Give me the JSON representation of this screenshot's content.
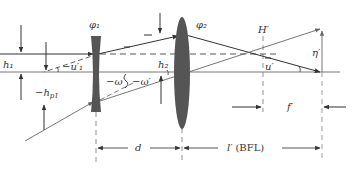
{
  "diagram": {
    "colors": {
      "line": "#333333",
      "ray": "#555555",
      "lens": "#555555",
      "dash": "#888888",
      "background": "#ffffff"
    },
    "labels": {
      "phi1": "φ₁",
      "phi2": "φ₂",
      "h1": "h₁",
      "h2": "h₂",
      "hp1": "−h",
      "hp1_sub": "p1",
      "u1p": "−u′₁",
      "omega": "−ω",
      "omegap": "−ω′",
      "Hp": "H′",
      "up": "u′",
      "etap": "η′",
      "fp": "f′",
      "d": "d",
      "lp": "l′",
      "bfl": "(BFL)",
      "dash_mark": "−"
    },
    "elements": {
      "lens1": {
        "type": "negative",
        "x": 96
      },
      "lens2": {
        "type": "positive",
        "x": 182
      },
      "principal_plane_Hp": {
        "x": 263
      },
      "focal_point": {
        "x": 322
      }
    }
  }
}
